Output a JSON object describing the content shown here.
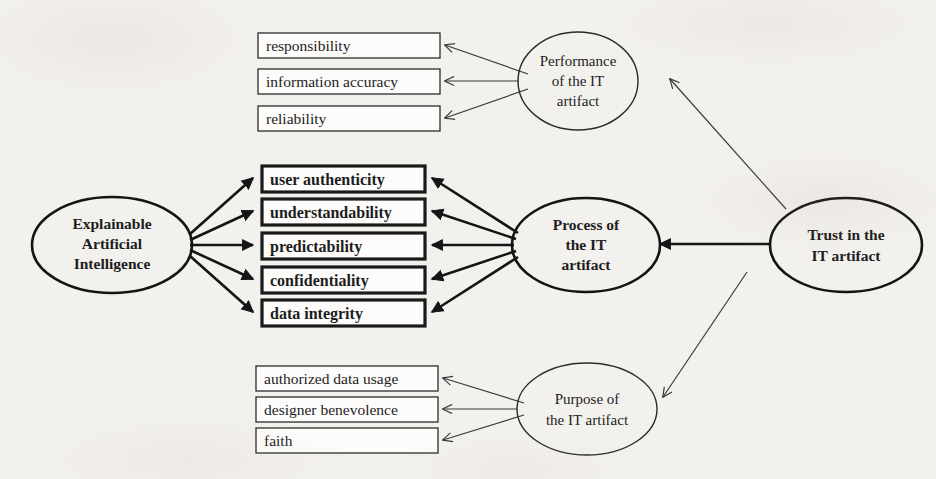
{
  "diagram": {
    "background_color": "#f3f1ee",
    "stroke_color": "#1d1d1d",
    "nodes": {
      "xai": {
        "label": "Explainable Artificial Intelligence",
        "lines": [
          "Explainable",
          "Artificial",
          "Intelligence"
        ],
        "shape": "ellipse",
        "emphasis": "bold"
      },
      "performance": {
        "label": "Performance of the IT artifact",
        "lines": [
          "Performance",
          "of the IT",
          "artifact"
        ],
        "shape": "ellipse",
        "emphasis": "normal"
      },
      "process": {
        "label": "Process of the IT artifact",
        "lines": [
          "Process of",
          "the IT",
          "artifact"
        ],
        "shape": "ellipse",
        "emphasis": "bold"
      },
      "purpose": {
        "label": "Purpose of the IT artifact",
        "lines": [
          "Purpose of",
          "the IT artifact"
        ],
        "shape": "ellipse",
        "emphasis": "normal"
      },
      "trust": {
        "label": "Trust in the IT artifact",
        "lines": [
          "Trust in the",
          "IT artifact"
        ],
        "shape": "ellipse",
        "emphasis": "bold"
      }
    },
    "groups": {
      "performance_attributes": {
        "emphasis": "normal",
        "items": [
          "responsibility",
          "information accuracy",
          "reliability"
        ]
      },
      "process_attributes": {
        "emphasis": "bold",
        "items": [
          "user authenticity",
          "understandability",
          "predictability",
          "confidentiality",
          "data integrity"
        ]
      },
      "purpose_attributes": {
        "emphasis": "normal",
        "items": [
          "authorized data usage",
          "designer benevolence",
          "faith"
        ]
      }
    },
    "edges": [
      {
        "from": "trust",
        "to": "performance",
        "style": "thin"
      },
      {
        "from": "trust",
        "to": "process",
        "style": "bold"
      },
      {
        "from": "trust",
        "to": "purpose",
        "style": "thin"
      },
      {
        "from": "performance",
        "to": "responsibility",
        "style": "thin"
      },
      {
        "from": "performance",
        "to": "information accuracy",
        "style": "thin"
      },
      {
        "from": "performance",
        "to": "reliability",
        "style": "thin"
      },
      {
        "from": "process",
        "to": "user authenticity",
        "style": "bold"
      },
      {
        "from": "process",
        "to": "understandability",
        "style": "bold"
      },
      {
        "from": "process",
        "to": "predictability",
        "style": "bold"
      },
      {
        "from": "process",
        "to": "confidentiality",
        "style": "bold"
      },
      {
        "from": "process",
        "to": "data integrity",
        "style": "bold"
      },
      {
        "from": "purpose",
        "to": "authorized data usage",
        "style": "thin"
      },
      {
        "from": "purpose",
        "to": "designer benevolence",
        "style": "thin"
      },
      {
        "from": "purpose",
        "to": "faith",
        "style": "thin"
      },
      {
        "from": "xai",
        "to": "user authenticity",
        "style": "bold"
      },
      {
        "from": "xai",
        "to": "understandability",
        "style": "bold"
      },
      {
        "from": "xai",
        "to": "predictability",
        "style": "bold"
      },
      {
        "from": "xai",
        "to": "confidentiality",
        "style": "bold"
      },
      {
        "from": "xai",
        "to": "data integrity",
        "style": "bold"
      }
    ]
  }
}
